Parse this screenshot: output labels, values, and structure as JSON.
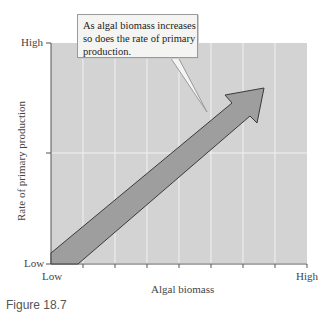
{
  "diagram": {
    "callout_text": "As algal biomass increases so does the rate of primary production.",
    "y_axis": {
      "label": "Rate of primary production",
      "high": "High",
      "low": "Low"
    },
    "x_axis": {
      "label": "Algal biomass",
      "high": "High",
      "low": "Low"
    },
    "caption": "Figure 18.7",
    "colors": {
      "plot_bg": "#d3d3d3",
      "arrow": "#9e9e9e",
      "grid": "#f0f0f0"
    }
  }
}
